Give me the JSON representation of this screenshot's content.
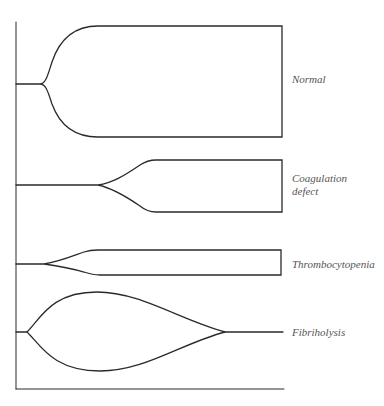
{
  "diagram": {
    "type": "thromboelastogram-patterns",
    "stroke_color": "#2a2a2a",
    "label_color": "#555555",
    "axes": {
      "y_axis": {
        "x": 16,
        "y1": 22,
        "y2": 389
      },
      "x_axis": {
        "y": 389,
        "x1": 16,
        "x2": 284
      }
    },
    "traces": [
      {
        "id": "normal",
        "label": "Normal",
        "label_lines": [
          "Normal"
        ]
      },
      {
        "id": "coagulation",
        "label": "Coagulation defect",
        "label_lines": [
          "Coagulation",
          "defect"
        ]
      },
      {
        "id": "thrombocytopenia",
        "label": "Thrombocytopenia",
        "label_lines": [
          "Thrombocytopenia"
        ]
      },
      {
        "id": "fibrinolysis",
        "label": "Fibriholysis",
        "label_lines": [
          "Fibriholysis"
        ]
      }
    ]
  }
}
